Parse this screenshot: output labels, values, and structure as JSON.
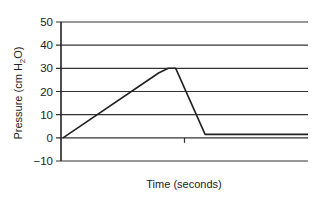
{
  "chart_data": {
    "type": "line",
    "title": "",
    "xlabel": "Time (seconds)",
    "ylabel": "Pressure (cm H2O)",
    "ylabel_parts": {
      "pre": "Pressure (cm H",
      "sub": "2",
      "post": "O)"
    },
    "ylim": [
      -10,
      50
    ],
    "yticks": [
      -10,
      0,
      10,
      20,
      30,
      40,
      50
    ],
    "ytick_labels": [
      "−10",
      "0",
      "10",
      "20",
      "30",
      "40",
      "50"
    ],
    "grid": true,
    "legend": null,
    "series": [
      {
        "name": "Airway pressure",
        "x": [
          0,
          0.39,
          0.43,
          0.46,
          0.58,
          1.0
        ],
        "y": [
          0,
          28,
          30,
          30,
          1.5,
          1.5
        ]
      }
    ],
    "x_tick_marks": [
      0.5
    ]
  }
}
